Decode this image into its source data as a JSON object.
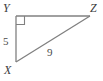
{
  "figure": {
    "kind": "right-triangle-diagram",
    "background_color": "#ffffff",
    "stroke_color": "#808080",
    "label_color": "#3b3b3b",
    "vertices": {
      "Y": {
        "label": "Y",
        "x": 16,
        "y": 16
      },
      "Z": {
        "label": "Z",
        "x": 90,
        "y": 16
      },
      "X": {
        "label": "X",
        "x": 16,
        "y": 62
      }
    },
    "right_angle": {
      "at_vertex": "Y",
      "marker": "right-angle-square"
    },
    "sides": [
      {
        "name": "YX",
        "label": "5",
        "type": "leg"
      },
      {
        "name": "XZ",
        "label": "9",
        "type": "hypotenuse"
      },
      {
        "name": "YZ",
        "label": "",
        "type": "leg"
      }
    ]
  }
}
